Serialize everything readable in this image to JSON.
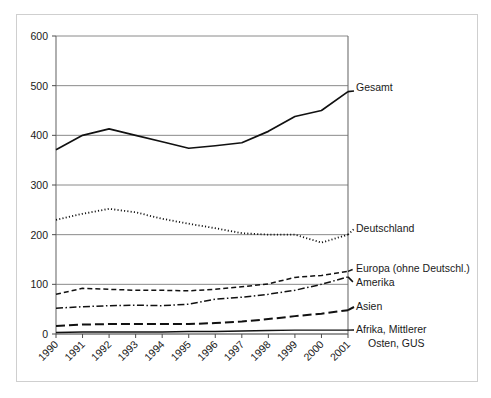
{
  "chart_data": {
    "type": "line",
    "title": "",
    "subtitle": "",
    "xlabel": "",
    "ylabel": "",
    "xlim": [
      1990,
      2001
    ],
    "ylim": [
      0,
      600
    ],
    "ytick_step": 100,
    "grid": true,
    "legend_position": "right-inline-labels",
    "categories": [
      "1990",
      "1991",
      "1992",
      "1993",
      "1994",
      "1995",
      "1996",
      "1997",
      "1998",
      "1999",
      "2000",
      "2001"
    ],
    "yticks": [
      "0",
      "100",
      "200",
      "300",
      "400",
      "500",
      "600"
    ],
    "series": [
      {
        "name": "Gesamt",
        "style": "solid",
        "color": "#111111",
        "values": [
          371,
          400,
          413,
          400,
          387,
          374,
          379,
          385,
          408,
          438,
          450,
          488
        ]
      },
      {
        "name": "Deutschland",
        "style": "dotted",
        "color": "#111111",
        "values": [
          230,
          242,
          252,
          245,
          232,
          222,
          213,
          203,
          200,
          200,
          184,
          200
        ]
      },
      {
        "name": "Europa (ohne Deutschl.)",
        "style": "dashed",
        "color": "#111111",
        "values": [
          80,
          92,
          90,
          88,
          88,
          87,
          90,
          95,
          101,
          114,
          118,
          126
        ]
      },
      {
        "name": "Amerika",
        "style": "dashdot",
        "color": "#111111",
        "values": [
          52,
          55,
          57,
          58,
          57,
          60,
          70,
          74,
          80,
          88,
          100,
          115
        ]
      },
      {
        "name": "Asien",
        "style": "longdash",
        "color": "#111111",
        "values": [
          16,
          19,
          20,
          20,
          20,
          20,
          22,
          25,
          30,
          36,
          41,
          48
        ]
      },
      {
        "name": "Afrika, Mittlerer Osten, GUS",
        "style": "solid-thin",
        "color": "#111111",
        "values": [
          3,
          4,
          4,
          4,
          4,
          5,
          5,
          6,
          7,
          8,
          8,
          8
        ]
      }
    ],
    "series_labels": [
      {
        "text": "Gesamt",
        "x": 356,
        "y": 91
      },
      {
        "text": "Deutschland",
        "x": 356,
        "y": 232
      },
      {
        "text": "Europa (ohne Deutschl.)",
        "x": 356,
        "y": 272
      },
      {
        "text": "Amerika",
        "x": 356,
        "y": 286
      },
      {
        "text": "Asien",
        "x": 356,
        "y": 310
      },
      {
        "text": "Afrika, Mittlerer",
        "x": 356,
        "y": 333
      },
      {
        "text": "Osten, GUS",
        "x": 368,
        "y": 347
      }
    ],
    "colors": {
      "line": "#111111",
      "grid": "#8a8a8a",
      "axis": "#6e6e6e",
      "frame": "#cfcfcf",
      "background": "#ffffff",
      "text": "#1a1a1a"
    }
  }
}
